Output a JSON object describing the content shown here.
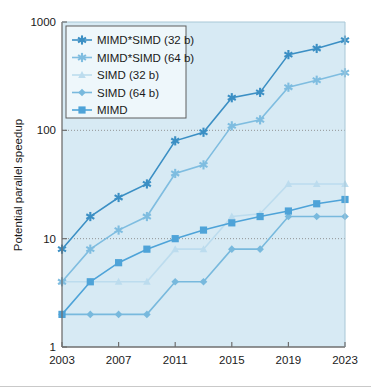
{
  "chart_data": {
    "type": "line",
    "title": "",
    "xlabel": "",
    "ylabel": "Potential parallel speedup",
    "yscale": "log",
    "ylim": [
      1,
      1000
    ],
    "xlim": [
      2003,
      2023
    ],
    "grid": "horizontal-dotted",
    "gridlines": [
      10,
      100
    ],
    "legend_position": "top-left",
    "x_ticks": [
      "2003",
      "2007",
      "2011",
      "2015",
      "2019",
      "2023"
    ],
    "y_ticks": [
      "1",
      "10",
      "100",
      "1000"
    ],
    "x": [
      2003,
      2005,
      2007,
      2009,
      2011,
      2013,
      2015,
      2017,
      2019,
      2021,
      2023
    ],
    "series": [
      {
        "name": "MIMD*SIMD (32 b)",
        "marker": "asterisk",
        "color": "#3b8fc4",
        "values": [
          8,
          16,
          24,
          32,
          80,
          96,
          200,
          224,
          500,
          570,
          680
        ]
      },
      {
        "name": "MIMD*SIMD (64 b)",
        "marker": "asterisk",
        "color": "#7fbde0",
        "values": [
          4,
          8,
          12,
          16,
          40,
          48,
          110,
          125,
          250,
          290,
          340
        ]
      },
      {
        "name": "SIMD (32 b)",
        "marker": "triangle",
        "color": "#bcdcee",
        "values": [
          4,
          4,
          4,
          4,
          8,
          8,
          16,
          17,
          32,
          32,
          32
        ]
      },
      {
        "name": "SIMD (64 b)",
        "marker": "diamond",
        "color": "#78b9dd",
        "values": [
          2,
          2,
          2,
          2,
          4,
          4,
          8,
          8,
          16,
          16,
          16
        ]
      },
      {
        "name": "MIMD",
        "marker": "square",
        "color": "#4ea3d8",
        "values": [
          2,
          4,
          6,
          8,
          10,
          12,
          14,
          16,
          18,
          21,
          23
        ]
      }
    ]
  },
  "legend": {
    "items": [
      {
        "label": "MIMD*SIMD (32 b)"
      },
      {
        "label": "MIMD*SIMD (64 b)"
      },
      {
        "label": "SIMD (32 b)"
      },
      {
        "label": "SIMD (64 b)"
      },
      {
        "label": "MIMD"
      }
    ]
  },
  "axes": {
    "y_title": "Potential parallel speedup",
    "y_tick_labels": [
      "1000",
      "100",
      "10",
      "1"
    ],
    "x_tick_labels": [
      "2003",
      "2007",
      "2011",
      "2015",
      "2019",
      "2023"
    ]
  },
  "colors": {
    "plot_background": "#d7eaf4",
    "axis": "#6f6f6f",
    "gridline": "#8a8a8a",
    "series_mimdsimd32": "#3b8fc4",
    "series_mimdsimd64": "#7fbde0",
    "series_simd32": "#bcdcee",
    "series_simd64": "#78b9dd",
    "series_mimd": "#4ea3d8"
  }
}
